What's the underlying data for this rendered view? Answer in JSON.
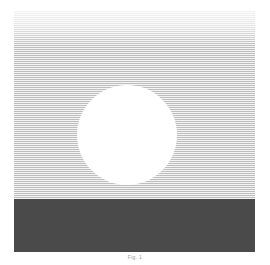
{
  "figure": {
    "caption": "Fig. 1",
    "panel": {
      "sky_label": "striped-sky",
      "sun_label": "sun-disc",
      "ground_label": "ground-band"
    }
  },
  "colors": {
    "background": "#ffffff",
    "sky_base": "#e9e9e9",
    "sky_stripe_dark": "#bdbdbd",
    "sky_stripe_light": "#f4f4f4",
    "sun": "#ffffff",
    "ground": "#4a4a4a",
    "caption_text": "#9a9a9a"
  },
  "chart_data": {
    "type": "area",
    "title": "Fig. 1",
    "xlabel": "",
    "ylabel": "",
    "categories": [
      "sky",
      "sun",
      "ground"
    ],
    "values": [
      147,
      100,
      53
    ],
    "annotations": [
      "Upper region: horizontal hatched stripe pattern (halftone sky)",
      "Center: solid white circular disc (sun) diameter 100 px",
      "Lower region: solid dark gray horizontal band (ground/water) height 53 px"
    ],
    "legend": []
  }
}
